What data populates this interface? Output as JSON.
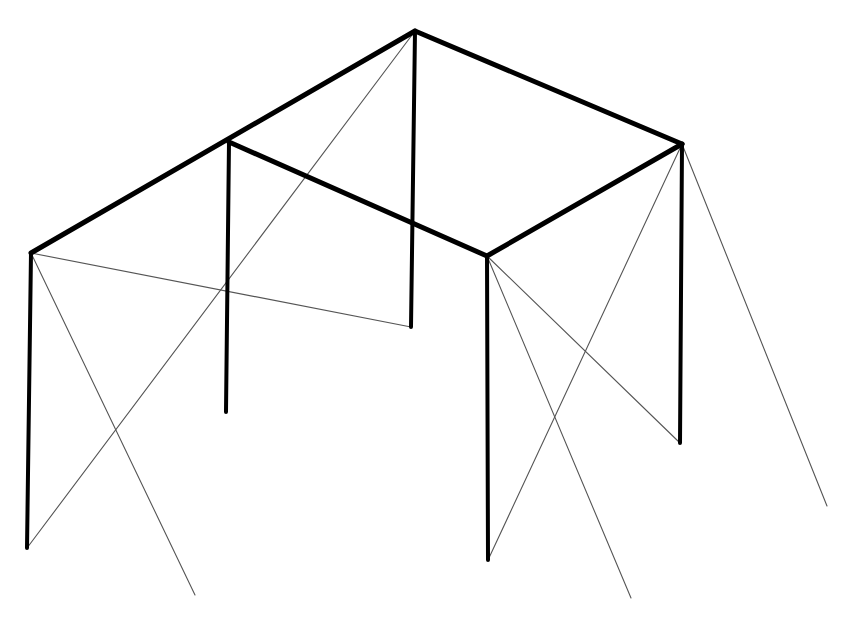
{
  "diagram": {
    "type": "3d-frame-line-drawing",
    "colors": {
      "background": "#ffffff",
      "frame": "#000000",
      "brace": "#555555"
    },
    "nodes": {
      "A_top": [
        31,
        253
      ],
      "B_top": [
        229,
        142
      ],
      "C_top": [
        415,
        31
      ],
      "D_top": [
        487,
        256
      ],
      "E_top": [
        682,
        144
      ],
      "A_bot": [
        27,
        548
      ],
      "B_bot": [
        226,
        412
      ],
      "C_bot": [
        411,
        327
      ],
      "D_bot": [
        488,
        560
      ],
      "E_bot": [
        680,
        443
      ]
    },
    "beams": [
      {
        "name": "beam-left-ridge",
        "from": "A_top",
        "to": "C_top"
      },
      {
        "name": "beam-back-right",
        "from": "C_top",
        "to": "E_top"
      },
      {
        "name": "beam-front-right",
        "from": "D_top",
        "to": "E_top"
      },
      {
        "name": "beam-middle",
        "from": "B_top",
        "to": "D_top"
      }
    ],
    "posts": [
      {
        "name": "post-a",
        "from": "A_top",
        "to": "A_bot"
      },
      {
        "name": "post-b",
        "from": "B_top",
        "to": "B_bot"
      },
      {
        "name": "post-c",
        "from": "C_top",
        "to": "C_bot"
      },
      {
        "name": "post-d",
        "from": "D_top",
        "to": "D_bot"
      },
      {
        "name": "post-e",
        "from": "E_top",
        "to": "E_bot"
      }
    ],
    "braces": [
      {
        "name": "brace-a-to-ground",
        "points": [
          [
            31,
            253
          ],
          [
            195,
            595
          ]
        ]
      },
      {
        "name": "brace-a-to-c-bottom",
        "points": [
          [
            31,
            253
          ],
          [
            411,
            327
          ]
        ]
      },
      {
        "name": "brace-a-bottom-to-c-top",
        "points": [
          [
            27,
            548
          ],
          [
            415,
            31
          ]
        ]
      },
      {
        "name": "brace-d-to-ground",
        "points": [
          [
            487,
            256
          ],
          [
            631,
            598
          ]
        ]
      },
      {
        "name": "brace-d-to-e-bottom",
        "points": [
          [
            487,
            256
          ],
          [
            680,
            443
          ]
        ]
      },
      {
        "name": "brace-d-bottom-to-e-top",
        "points": [
          [
            488,
            560
          ],
          [
            682,
            144
          ]
        ]
      },
      {
        "name": "brace-e-to-ground",
        "points": [
          [
            682,
            144
          ],
          [
            827,
            506
          ]
        ]
      }
    ]
  }
}
